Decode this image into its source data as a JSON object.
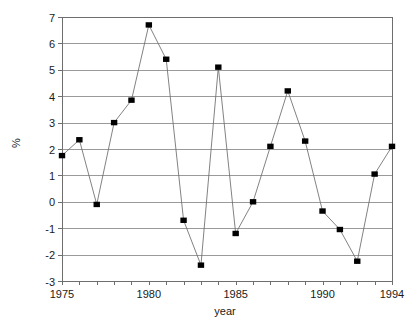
{
  "chart_data": {
    "type": "line",
    "title": "",
    "xlabel": "year",
    "ylabel": "%",
    "xlim": [
      1975,
      1994
    ],
    "ylim": [
      -3,
      7
    ],
    "grid": true,
    "legend": false,
    "marker": "filled-square",
    "x": [
      1975,
      1976,
      1977,
      1978,
      1979,
      1980,
      1981,
      1982,
      1983,
      1984,
      1985,
      1986,
      1987,
      1988,
      1989,
      1990,
      1991,
      1992,
      1993,
      1994
    ],
    "values": [
      1.75,
      2.35,
      -0.1,
      3.0,
      3.85,
      6.7,
      5.4,
      -0.7,
      -2.4,
      5.1,
      -1.2,
      0.0,
      2.1,
      4.2,
      2.3,
      -0.35,
      -1.05,
      -2.25,
      1.05,
      2.1
    ],
    "x_tick_labels": [
      "1975",
      "1980",
      "1985",
      "1990",
      "1994"
    ],
    "x_tick_values": [
      1975,
      1980,
      1985,
      1990,
      1994
    ],
    "x_minor_ticks": [
      1975,
      1976,
      1977,
      1978,
      1979,
      1980,
      1981,
      1982,
      1983,
      1984,
      1985,
      1986,
      1987,
      1988,
      1989,
      1990,
      1991,
      1992,
      1993,
      1994
    ],
    "y_tick_labels": [
      "7",
      "6",
      "5",
      "4",
      "3",
      "2",
      "1",
      "0",
      "-1",
      "-2",
      "-3"
    ],
    "y_tick_values": [
      7,
      6,
      5,
      4,
      3,
      2,
      1,
      0,
      -1,
      -2,
      -3
    ],
    "colors": {
      "marker": "#000000",
      "line": "#6b6b6b",
      "grid": "#8f8f8f",
      "frame": "#6e6e6e",
      "background": "#ffffff",
      "text": "#1a1a1a"
    }
  }
}
